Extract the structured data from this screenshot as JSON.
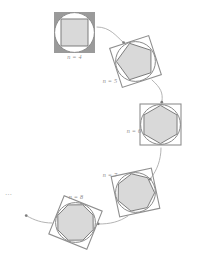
{
  "figure": {
    "kind": "diagram",
    "caption_text": "",
    "background_color": "#ffffff",
    "width": 197,
    "height": 259,
    "ellipsis": "…",
    "ellipsis_position": {
      "x": 9,
      "y": 193
    },
    "palette": {
      "square_fill": "#9a9a9a",
      "square_stroke": "#8f8f8f",
      "circle_fill": "#ffffff",
      "circle_stroke": "#8a8a8a",
      "polygon_fill": "#d9d9d9",
      "polygon_stroke": "#707070",
      "arrow_color": "#a6a6a6",
      "label_color": "#8c8c8c"
    },
    "stages": [
      {
        "id": "stage-n4",
        "label": "n = 4",
        "sides": 4,
        "center": {
          "x": 74.5,
          "y": 32.5
        },
        "radius": 20.5,
        "rotation_deg": 45,
        "square_filled": true,
        "label_position": {
          "x": 74.5,
          "y": 57
        }
      },
      {
        "id": "stage-n5",
        "label": "n = 5",
        "sides": 5,
        "center": {
          "x": 135.5,
          "y": 61.5
        },
        "radius": 20.5,
        "rotation_deg": -18,
        "square_filled": false,
        "label_position": {
          "x": 110,
          "y": 81
        }
      },
      {
        "id": "stage-n6",
        "label": "n = 6",
        "sides": 6,
        "center": {
          "x": 160.5,
          "y": 124.5
        },
        "radius": 20.5,
        "rotation_deg": 0,
        "square_filled": false,
        "label_position": {
          "x": 134,
          "y": 131
        }
      },
      {
        "id": "stage-n7",
        "label": "n = 7",
        "sides": 7,
        "center": {
          "x": 135.5,
          "y": 192.5
        },
        "radius": 20.5,
        "rotation_deg": -12,
        "square_filled": false,
        "label_position": {
          "x": 110,
          "y": 175
        }
      },
      {
        "id": "stage-n8",
        "label": "n = 8",
        "sides": 8,
        "center": {
          "x": 75.5,
          "y": 222.5
        },
        "radius": 20.5,
        "rotation_deg": 22,
        "square_filled": false,
        "label_position": {
          "x": 76,
          "y": 197
        }
      }
    ],
    "arrows": [
      {
        "id": "arrow-n4-to-n5",
        "from": "stage-n4",
        "to": "stage-n5",
        "path": "M 97 27 C 110 27, 116 36, 123 42",
        "head": {
          "x": 123.6,
          "y": 42.6
        }
      },
      {
        "id": "arrow-n5-to-n6",
        "from": "stage-n5",
        "to": "stage-n6",
        "path": "M 152 80 C 161 88, 163 93, 162 101",
        "head": {
          "x": 161.8,
          "y": 102.2
        }
      },
      {
        "id": "arrow-n6-to-n7",
        "from": "stage-n6",
        "to": "stage-n7",
        "path": "M 161 148 C 161 160, 157 170, 151 178",
        "head": {
          "x": 150.2,
          "y": 179.2
        }
      },
      {
        "id": "arrow-n7-to-n8",
        "from": "stage-n7",
        "to": "stage-n8",
        "path": "M 128 216 C 119 222, 110 224, 99 224",
        "head": {
          "x": 98.2,
          "y": 223.8
        }
      },
      {
        "id": "arrow-n8-to-ellipsis",
        "from": "stage-n8",
        "to": "ellipsis",
        "path": "M 52 223 C 42 223, 34 220, 27 216",
        "head": {
          "x": 26.2,
          "y": 215.6
        }
      }
    ]
  }
}
